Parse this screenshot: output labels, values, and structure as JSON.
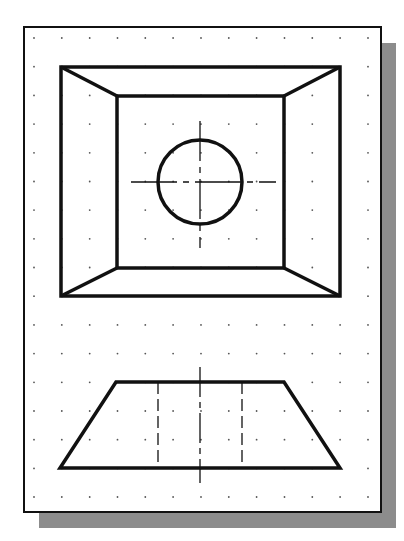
{
  "colors": {
    "background": "#ffffff",
    "paper": "#ffffff",
    "line": "#111111",
    "shadow": "#8c8c8c",
    "grid_dot": "#555555"
  },
  "sheet": {
    "x": 24,
    "y": 27,
    "width": 357,
    "height": 485,
    "border_width": 2,
    "shadow": {
      "offset_x": 15,
      "offset_y": 16
    }
  },
  "grid": {
    "start_x": 34,
    "start_y": 38,
    "step_x": 27.83,
    "step_y": 28.69,
    "cols": 13,
    "rows": 17
  },
  "top_view": {
    "label": "Top view",
    "outer_rect": {
      "x1": 61,
      "y1": 67,
      "x2": 340,
      "y2": 296
    },
    "inner_rect": {
      "x1": 117,
      "y1": 96,
      "x2": 284,
      "y2": 268
    },
    "hole": {
      "cx": 200,
      "cy": 182,
      "r": 42
    },
    "center_lines": {
      "horizontal": {
        "x1": 131,
        "x2": 276,
        "y": 182
      },
      "vertical": {
        "x": 200,
        "y1": 121,
        "y2": 248
      }
    }
  },
  "front_view": {
    "label": "Front view",
    "trapezoid": [
      [
        116,
        382
      ],
      [
        284,
        382
      ],
      [
        340,
        468
      ],
      [
        60,
        468
      ]
    ],
    "hidden_lines": [
      {
        "x": 158,
        "y1": 382,
        "y2": 468
      },
      {
        "x": 242,
        "y1": 382,
        "y2": 468
      }
    ],
    "center_line": {
      "x": 200,
      "y1": 367,
      "y2": 483
    }
  }
}
